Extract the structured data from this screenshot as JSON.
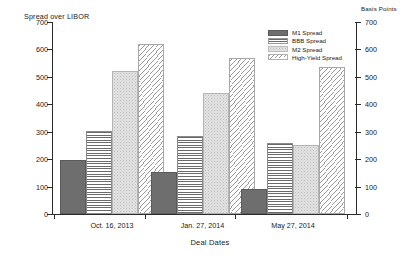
{
  "chart_data": {
    "type": "bar",
    "title": "",
    "ylabel": "Spread over LIBOR",
    "y2label": "Basis Points",
    "xlabel": "Deal Dates",
    "categories": [
      "Oct. 16, 2013",
      "Jan. 27, 2014",
      "May 27, 2014"
    ],
    "series": [
      {
        "name": "M1 Spread",
        "key": "m1",
        "values": [
          197,
          155,
          92
        ]
      },
      {
        "name": "BBB Spread",
        "key": "bbb",
        "values": [
          303,
          283,
          258
        ]
      },
      {
        "name": "M2 Spread",
        "key": "m2",
        "values": [
          522,
          440,
          252
        ]
      },
      {
        "name": "High-Yield Spread",
        "key": "hy",
        "values": [
          620,
          570,
          535
        ]
      }
    ],
    "ylim": [
      0,
      700
    ],
    "yticks": [
      0,
      100,
      200,
      300,
      400,
      500,
      600,
      700
    ],
    "ytick_labels": [
      "0",
      "100",
      "200",
      "300",
      "400",
      "500",
      "600",
      "700"
    ],
    "y2lim": [
      0,
      700
    ],
    "y2ticks": [
      0,
      100,
      200,
      300,
      400,
      500,
      600,
      700
    ],
    "y2tick_labels": [
      "0",
      "100",
      "200",
      "300",
      "400",
      "500",
      "600",
      "700"
    ],
    "grid": false,
    "legend_position": "top-right",
    "legend_entries": [
      "M1 Spread",
      "BBB Spread",
      "M2 Spread",
      "High-Yield Spread"
    ],
    "colors": {
      "m1": "#6e6e6e",
      "bbb": "#6a6a6a",
      "m2": "#e2e2e2",
      "hy": "#9a9a9a",
      "axis": "#2b2b2b",
      "background": "#ffffff"
    }
  }
}
